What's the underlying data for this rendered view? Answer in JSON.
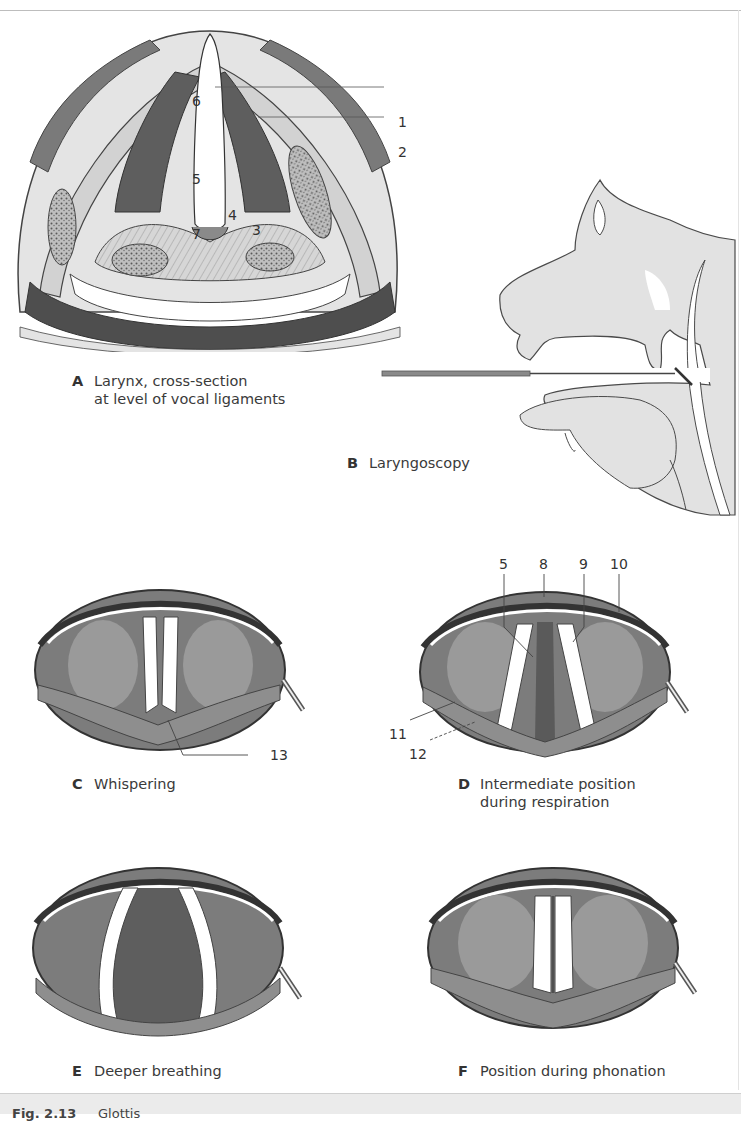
{
  "figure": {
    "number_label": "Fig. 2.13",
    "title": "Glottis",
    "colors": {
      "tissue_dark": "#5a5a5a",
      "tissue_mid": "#9a9a9a",
      "tissue_light": "#d9d9d9",
      "profile_fill": "#e0e0e0",
      "caption_bar": "#ebebeb"
    }
  },
  "panels": [
    {
      "id": "A",
      "letter": "A",
      "line1": "Larynx, cross-section",
      "line2": "at level of vocal ligaments"
    },
    {
      "id": "B",
      "letter": "B",
      "line1": "Laryngoscopy",
      "line2": ""
    },
    {
      "id": "C",
      "letter": "C",
      "line1": "Whispering",
      "line2": ""
    },
    {
      "id": "D",
      "letter": "D",
      "line1": "Intermediate position",
      "line2": "during respiration"
    },
    {
      "id": "E",
      "letter": "E",
      "line1": "Deeper breathing",
      "line2": ""
    },
    {
      "id": "F",
      "letter": "F",
      "line1": "Position during phonation",
      "line2": ""
    }
  ],
  "callouts": {
    "A": {
      "n1": "1",
      "n2": "2",
      "n3": "3",
      "n4": "4",
      "n5": "5",
      "n6": "6",
      "n7": "7"
    },
    "C": {
      "n13": "13"
    },
    "D": {
      "n5": "5",
      "n8": "8",
      "n9": "9",
      "n10": "10",
      "n11": "11",
      "n12": "12"
    }
  }
}
